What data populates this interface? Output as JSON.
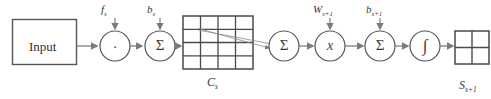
{
  "diagram": {
    "type": "neural-network-layer-flowchart",
    "title": "",
    "input_block": {
      "label": "Input",
      "x": 12,
      "y": 19,
      "w": 64,
      "h": 45
    },
    "nodes": [
      {
        "id": "mul-f",
        "glyph": "·",
        "glyph_name": "dot-operator",
        "cx": 115,
        "cy": 46,
        "r": 15
      },
      {
        "id": "sum-b",
        "glyph": "Σ",
        "glyph_name": "sigma-summation",
        "cx": 160,
        "cy": 46,
        "r": 15
      },
      {
        "id": "sum-pool",
        "glyph": "Σ",
        "glyph_name": "sigma-summation",
        "cx": 284,
        "cy": 46,
        "r": 15
      },
      {
        "id": "mul-w",
        "glyph": "x",
        "glyph_name": "multiply-operator",
        "cx": 330,
        "cy": 46,
        "r": 15
      },
      {
        "id": "sum-b2",
        "glyph": "Σ",
        "glyph_name": "sigma-summation",
        "cx": 380,
        "cy": 46,
        "r": 15
      },
      {
        "id": "activation",
        "glyph": "∫",
        "glyph_name": "integral-activation",
        "cx": 425,
        "cy": 46,
        "r": 15
      }
    ],
    "top_labels": [
      {
        "id": "f-s",
        "base": "f",
        "sub": "s",
        "x": 101,
        "y": 4,
        "arrow_x": 115,
        "arrow_y0": 18,
        "arrow_y1": 31
      },
      {
        "id": "b-s",
        "base": "b",
        "sub": "s",
        "x": 147,
        "y": 4,
        "arrow_x": 160,
        "arrow_y0": 18,
        "arrow_y1": 31
      },
      {
        "id": "W-s1",
        "base": "W",
        "sub": "s+1",
        "x": 313,
        "y": 4,
        "arrow_x": 330,
        "arrow_y0": 18,
        "arrow_y1": 31
      },
      {
        "id": "b-s1",
        "base": "b",
        "sub": "s+1",
        "x": 366,
        "y": 4,
        "arrow_x": 380,
        "arrow_y0": 18,
        "arrow_y1": 31
      }
    ],
    "bottom_labels": [
      {
        "id": "C-s",
        "base": "C",
        "sub": "s",
        "x": 207,
        "y": 76
      },
      {
        "id": "S-s1",
        "base": "S",
        "sub": "s+1",
        "x": 459,
        "y": 80
      }
    ],
    "feature_map_c": {
      "name": "C_s",
      "rows": 4,
      "cols": 4,
      "x": 183,
      "y": 16,
      "w": 70,
      "h": 53
    },
    "feature_map_s": {
      "name": "S_s+1",
      "rows": 2,
      "cols": 2,
      "x": 455,
      "y": 31,
      "w": 34,
      "h": 33
    },
    "pooling_lines": [
      {
        "from_x": 198,
        "from_y": 31,
        "to_x": 269,
        "to_y": 44
      },
      {
        "from_x": 198,
        "from_y": 29,
        "to_x": 269,
        "to_y": 48
      }
    ],
    "colors": {
      "stroke": "#555555",
      "grid_stroke": "#4a4a4a",
      "thin_stroke": "#7a7a7a",
      "text": "#333333",
      "background": "#ffffff"
    }
  }
}
